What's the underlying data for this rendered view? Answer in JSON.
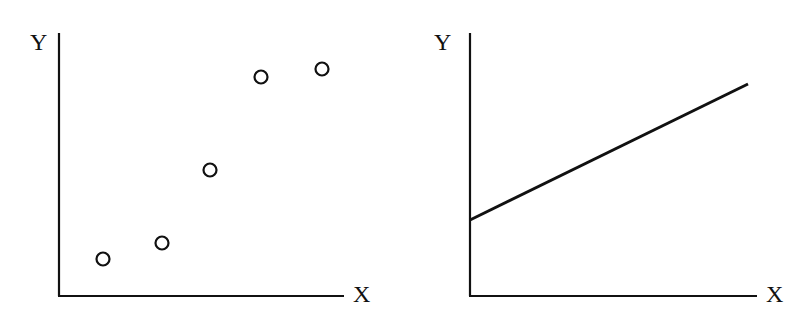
{
  "colors": {
    "ink": "#111111",
    "background": "#ffffff"
  },
  "panels": [
    {
      "id": "left",
      "type": "scatter",
      "y_label": "Y",
      "x_label": "X",
      "axes": {
        "origin": [
          59,
          296
        ],
        "y_top": 33,
        "x_right": 344
      },
      "label_pos": {
        "y": [
          30,
          50
        ],
        "x": [
          353,
          302
        ]
      },
      "points": [
        [
          103,
          259
        ],
        [
          162,
          243
        ],
        [
          210,
          170
        ],
        [
          261,
          77
        ],
        [
          322,
          69
        ]
      ]
    },
    {
      "id": "right",
      "type": "line",
      "y_label": "Y",
      "x_label": "X",
      "axes": {
        "origin": [
          470,
          296
        ],
        "y_top": 33,
        "x_right": 757
      },
      "label_pos": {
        "y": [
          434,
          50
        ],
        "x": [
          766,
          302
        ]
      },
      "line": [
        [
          470,
          220
        ],
        [
          748,
          84
        ]
      ]
    }
  ],
  "chart_data": [
    {
      "type": "scatter",
      "title": "",
      "xlabel": "X",
      "ylabel": "Y",
      "grid": false,
      "ticks": false,
      "x": [
        0.15,
        0.36,
        0.53,
        0.71,
        0.92
      ],
      "y": [
        0.14,
        0.2,
        0.48,
        0.83,
        0.86
      ],
      "xlim": [
        0,
        1
      ],
      "ylim": [
        0,
        1
      ],
      "note": "Unlabeled axes; values normalized to axis extent. Points rise from lower-left to upper-right, leveling off at the top."
    },
    {
      "type": "line",
      "title": "",
      "xlabel": "X",
      "ylabel": "Y",
      "grid": false,
      "ticks": false,
      "x": [
        0,
        0.97
      ],
      "y": [
        0.29,
        0.81
      ],
      "xlim": [
        0,
        1
      ],
      "ylim": [
        0,
        1
      ],
      "note": "Unlabeled axes; straight line with positive slope and positive Y-intercept."
    }
  ]
}
